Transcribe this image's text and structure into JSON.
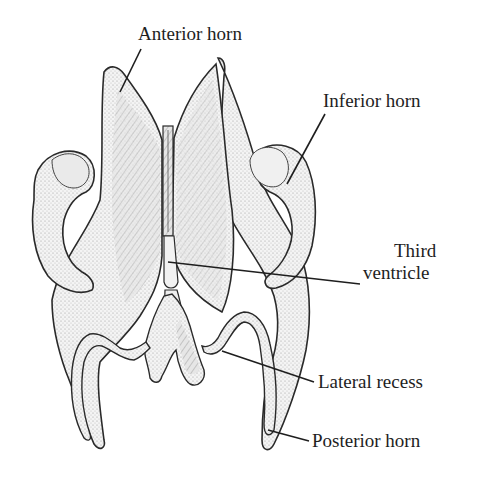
{
  "figure": {
    "colors": {
      "outline": "#2a2a2a",
      "fill": "#efefef",
      "shade": "#c8c8c8",
      "text": "#1e1e1e",
      "background": "#ffffff"
    }
  },
  "labels": {
    "anterior_horn": "Anterior horn",
    "inferior_horn": "Inferior horn",
    "third_ventricle_line1": "Third",
    "third_ventricle_line2": "ventricle",
    "lateral_recess": "Lateral recess",
    "posterior_horn": "Posterior horn"
  }
}
